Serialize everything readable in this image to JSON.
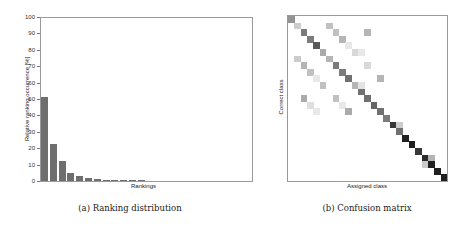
{
  "figure": {
    "left": {
      "caption": "(a) Ranking distribution",
      "xlabel": "Rankings",
      "ylabel": "Relative ranking occurrence [%]"
    },
    "right": {
      "caption": "(b) Confusion matrix",
      "xlabel": "Assigned class",
      "ylabel": "Correct class"
    }
  },
  "chart_data": [
    {
      "type": "bar",
      "title": "Ranking distribution",
      "xlabel": "Rankings",
      "ylabel": "Relative ranking occurrence [%]",
      "ylim": [
        0,
        100
      ],
      "yticks": [
        0,
        10,
        20,
        30,
        40,
        50,
        60,
        70,
        80,
        90,
        100
      ],
      "grid": false,
      "categories": [
        1,
        2,
        3,
        4,
        5,
        6,
        7,
        8,
        9,
        10,
        11,
        12
      ],
      "values": [
        51,
        22.5,
        12.5,
        5,
        3,
        2,
        1.2,
        0.7,
        0.3,
        0.2,
        0.1,
        0.1
      ],
      "bar_color": "#6e6e6e"
    },
    {
      "type": "heatmap",
      "title": "Confusion matrix",
      "xlabel": "Assigned class",
      "ylabel": "Correct class",
      "size": 25,
      "note": "Grayscale intensity; diagonal dominant, darker toward bottom-right",
      "diagonal": [
        0.45,
        0.2,
        0.55,
        0.55,
        0.7,
        0.35,
        0.3,
        0.55,
        0.55,
        0.6,
        0.3,
        0.6,
        0.6,
        0.65,
        0.6,
        0.55,
        0.85,
        0.6,
        0.95,
        0.95,
        0.85,
        0.9,
        0.95,
        0.95,
        0.95
      ],
      "off_diagonal": [
        {
          "row": 1,
          "col": 6,
          "v": 0.25
        },
        {
          "row": 2,
          "col": 7,
          "v": 0.25
        },
        {
          "row": 2,
          "col": 12,
          "v": 0.3
        },
        {
          "row": 3,
          "col": 8,
          "v": 0.3
        },
        {
          "row": 4,
          "col": 9,
          "v": 0.08
        },
        {
          "row": 5,
          "col": 10,
          "v": 0.15
        },
        {
          "row": 5,
          "col": 11,
          "v": 0.08
        },
        {
          "row": 6,
          "col": 1,
          "v": 0.2
        },
        {
          "row": 7,
          "col": 2,
          "v": 0.3
        },
        {
          "row": 7,
          "col": 12,
          "v": 0.15
        },
        {
          "row": 8,
          "col": 3,
          "v": 0.25
        },
        {
          "row": 9,
          "col": 4,
          "v": 0.08
        },
        {
          "row": 9,
          "col": 14,
          "v": 0.3
        },
        {
          "row": 10,
          "col": 5,
          "v": 0.25
        },
        {
          "row": 10,
          "col": 11,
          "v": 0.1
        },
        {
          "row": 12,
          "col": 2,
          "v": 0.35
        },
        {
          "row": 12,
          "col": 7,
          "v": 0.25
        },
        {
          "row": 13,
          "col": 3,
          "v": 0.12
        },
        {
          "row": 13,
          "col": 8,
          "v": 0.08
        },
        {
          "row": 14,
          "col": 4,
          "v": 0.08
        },
        {
          "row": 14,
          "col": 9,
          "v": 0.35
        },
        {
          "row": 16,
          "col": 16,
          "v": 0.12
        },
        {
          "row": 16,
          "col": 17,
          "v": 0.2
        },
        {
          "row": 21,
          "col": 22,
          "v": 0.3
        },
        {
          "row": 22,
          "col": 21,
          "v": 0.2
        }
      ]
    }
  ]
}
